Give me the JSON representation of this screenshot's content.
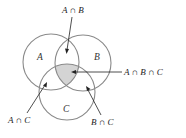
{
  "diagram": {
    "type": "venn",
    "sets": [
      {
        "id": "A",
        "label": "A",
        "cx": 51,
        "cy": 62,
        "r": 28
      },
      {
        "id": "B",
        "label": "B",
        "cx": 83,
        "cy": 63,
        "r": 28
      },
      {
        "id": "C",
        "label": "C",
        "cx": 67,
        "cy": 92,
        "r": 28
      }
    ],
    "shaded_region": "A ∩ B ∩ C",
    "annotations": {
      "ab": "A ∩ B",
      "abc": "A ∩ B ∩ C",
      "ac": "A ∩ C",
      "bc": "B ∩ C"
    },
    "colors": {
      "circle_stroke": "#8a8a8a",
      "shade_fill": "#d4d4d4",
      "text": "#222222"
    }
  }
}
